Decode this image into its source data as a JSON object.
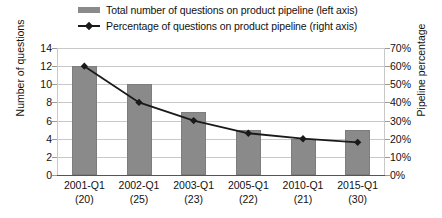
{
  "chart_data": {
    "type": "bar",
    "title": "",
    "subtitle": "",
    "categories": [
      "2001-Q1",
      "2002-Q1",
      "2003-Q1",
      "2005-Q1",
      "2010-Q1",
      "2015-Q1"
    ],
    "category_sublabels": [
      "(20)",
      "(25)",
      "(23)",
      "(22)",
      "(21)",
      "(30)"
    ],
    "xlabel": "",
    "ylabel": "Number of questions",
    "y2label": "Pipeline percentage",
    "ylim": [
      0,
      14
    ],
    "y2lim": [
      0,
      70
    ],
    "yticks": [
      0,
      2,
      4,
      6,
      8,
      10,
      12,
      14
    ],
    "ytick_labels": [
      "0",
      "2",
      "4",
      "6",
      "8",
      "10",
      "12",
      "14"
    ],
    "y2ticks": [
      0,
      10,
      20,
      30,
      40,
      50,
      60,
      70
    ],
    "y2tick_labels": [
      "0%",
      "10%",
      "20%",
      "30%",
      "40%",
      "50%",
      "60%",
      "70%"
    ],
    "grid": true,
    "legend_position": "top",
    "series": [
      {
        "name": "Total number of questions on product pipeline (left axis)",
        "type": "bar",
        "axis": "left",
        "color": "#8a8a8a",
        "values": [
          12,
          10,
          7,
          5,
          4,
          5
        ]
      },
      {
        "name": "Percentage of questions on product pipeline (right axis)",
        "type": "line",
        "axis": "right",
        "color": "#1a1a1a",
        "values": [
          60,
          40,
          30,
          23,
          20,
          18
        ]
      }
    ]
  },
  "legend": {
    "items": [
      {
        "label": "Total number of questions on product pipeline (left axis)",
        "marker": "bar-swatch"
      },
      {
        "label": "Percentage of questions on product pipeline (right axis)",
        "marker": "line-marker-swatch"
      }
    ]
  },
  "colors": {
    "bar": "#8a8a8a",
    "line": "#1a1a1a",
    "grid": "#c9c9c9",
    "axis": "#555555",
    "background": "#ffffff"
  }
}
